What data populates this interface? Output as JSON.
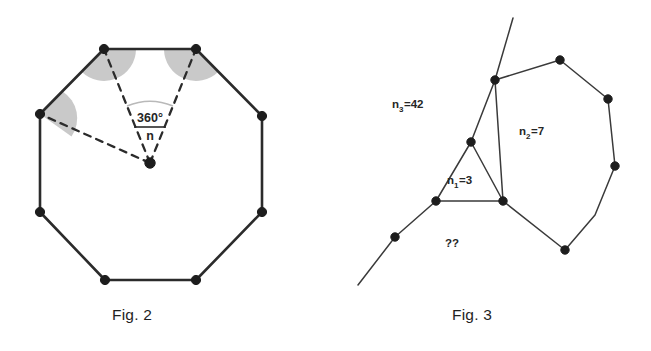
{
  "page": {
    "background": "#ffffff",
    "ink": "#2b2b2b",
    "shade": "#c9c9c9",
    "width": 651,
    "height": 351
  },
  "figures": [
    {
      "id": "fig2",
      "caption": "Fig. 2",
      "shape": "regular-octagon",
      "center_angle_numerator": "360°",
      "center_angle_denominator": "n",
      "vertex_count": 8,
      "shaded_interior_angles": 3,
      "dashed_radii": 3
    },
    {
      "id": "fig3",
      "caption": "Fig. 3",
      "regions": [
        {
          "name": "triangle",
          "label_base": "n",
          "label_sub": "1",
          "label_value": "=3",
          "label_text": "n1=3"
        },
        {
          "name": "heptagon",
          "label_base": "n",
          "label_sub": "2",
          "label_value": "=7",
          "label_text": "n2=7"
        },
        {
          "name": "outer-region",
          "label_base": "n",
          "label_sub": "3",
          "label_value": "=42",
          "label_text": "n3=42"
        },
        {
          "name": "unknown-region",
          "label_base": "",
          "label_sub": "",
          "label_value": "",
          "label_text": "??"
        }
      ],
      "unknown_marker": "??"
    }
  ],
  "fig2": {
    "caption": "Fig. 2",
    "fraction_numerator": "360°",
    "fraction_denominator": "n"
  },
  "fig3": {
    "caption": "Fig. 3",
    "label_n3_base": "n",
    "label_n3_sub": "3",
    "label_n3_eq": "=42",
    "label_n2_base": "n",
    "label_n2_sub": "2",
    "label_n2_eq": "=7",
    "label_n1_base": "n",
    "label_n1_sub": "1",
    "label_n1_eq": "=3",
    "label_unknown": "??"
  }
}
